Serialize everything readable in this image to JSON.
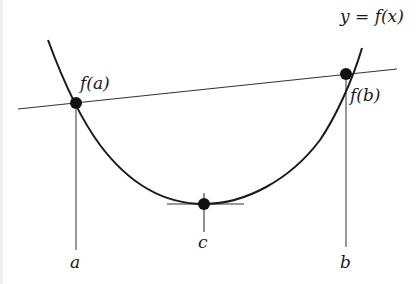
{
  "diagram": {
    "curve_label": "y = f(x)",
    "labels": {
      "fa": "f(a)",
      "fb": "f(b)",
      "a": "a",
      "b": "b",
      "c": "c"
    },
    "points": [
      {
        "id": "A",
        "label": "f(a)",
        "x": 76,
        "y": 103
      },
      {
        "id": "B",
        "label": "f(b)",
        "x": 346,
        "y": 74
      },
      {
        "id": "C",
        "label": "c",
        "x": 204,
        "y": 204
      }
    ],
    "colors": {
      "stroke": "#1a1a1a",
      "thin": "#333333",
      "background": "#ffffff"
    }
  }
}
